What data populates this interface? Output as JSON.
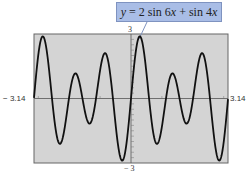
{
  "chart_data": {
    "type": "line",
    "title": "",
    "equation": "y = 2 sin 6x + sin 4x",
    "function": "2*sin(6x)+sin(4x)",
    "xlim": [
      -3.14,
      3.14
    ],
    "ylim": [
      -3,
      3
    ],
    "tick_labels": {
      "xmin": "− 3.14",
      "xmax": "3.14",
      "ymax": "3",
      "ymin": "− 3"
    },
    "grid": false,
    "background": "#d4d4d4",
    "line_color": "#111111",
    "callout_color": "#a9bde6"
  },
  "callout": {
    "y": "y",
    "eq": "=",
    "rest1": "2 sin 6",
    "x1": "x",
    "plus": "+",
    "rest2": "sin 4",
    "x2": "x"
  }
}
